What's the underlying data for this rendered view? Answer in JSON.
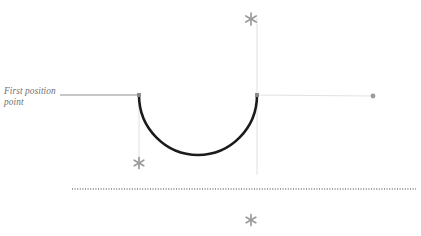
{
  "figure": {
    "background_color": "#ffffff",
    "clipped_top_text": "",
    "annotation": {
      "text": "First position point",
      "color": "#6f6f6f",
      "style": "italic",
      "leader_line_color": "#909090",
      "leader_from_x": 60,
      "leader_to_x": 139,
      "leader_y": 95
    },
    "arc": {
      "name": "u-shaped-arc",
      "color": "#1b1b1b",
      "stroke_width": 2.6,
      "left_x": 139,
      "right_x": 257,
      "top_y": 95,
      "bottom_y": 155
    },
    "endpoints": [
      {
        "name": "first-position-point-marker",
        "shape": "square",
        "x": 139,
        "y": 95,
        "size": 4,
        "color": "#8a8a8a"
      },
      {
        "name": "second-position-point-marker",
        "shape": "square",
        "x": 257,
        "y": 95,
        "size": 4,
        "color": "#8a8a8a"
      }
    ],
    "dot_marker": {
      "name": "end-dot-marker",
      "shape": "circle",
      "x": 373,
      "y": 96,
      "radius": 2.4,
      "color": "#9a9a9a"
    },
    "construction_lines": [
      {
        "name": "horizontal-guide-right",
        "x1": 257,
        "y1": 95,
        "x2": 373,
        "y2": 96,
        "color": "#e2e2e2",
        "width": 1
      },
      {
        "name": "vertical-guide-left",
        "x1": 139,
        "y1": 95,
        "x2": 139,
        "y2": 163,
        "color": "#e0e0e0",
        "width": 1
      },
      {
        "name": "vertical-guide-right",
        "x1": 257,
        "y1": 18,
        "x2": 257,
        "y2": 175,
        "color": "#e0e0e0",
        "width": 1
      }
    ],
    "dotted_reference_line": {
      "name": "ground-reference-line",
      "x1": 72,
      "x2": 416,
      "y": 189,
      "color": "#3a3a3a",
      "width": 1,
      "dash": "1 1.6"
    },
    "stars": [
      {
        "name": "star-marker-top",
        "x": 251,
        "y": 19,
        "size": 12,
        "color": "#9b9b9b"
      },
      {
        "name": "star-marker-left",
        "x": 139,
        "y": 163,
        "size": 11,
        "color": "#9b9b9b"
      },
      {
        "name": "star-marker-bottom",
        "x": 251,
        "y": 220,
        "size": 11,
        "color": "#9b9b9b"
      }
    ]
  }
}
